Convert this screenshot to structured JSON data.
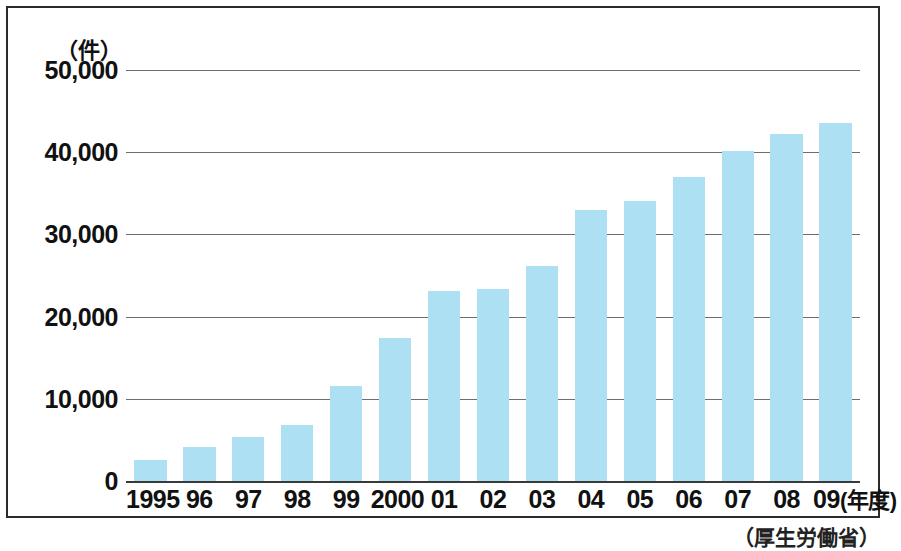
{
  "chart_data": {
    "type": "bar",
    "title": "",
    "subtitle": "",
    "unit_label": "（件）",
    "xlabel": "",
    "ylabel": "",
    "axis_suffix": "(年度)",
    "source": "（厚生労働省）",
    "bar_color": "#ace0f2",
    "grid": true,
    "legend": "none",
    "ylim": [
      0,
      50000
    ],
    "yticks": [
      0,
      10000,
      20000,
      30000,
      40000,
      50000
    ],
    "ytick_labels": [
      "0",
      "10,000",
      "20,000",
      "30,000",
      "40,000",
      "50,000"
    ],
    "categories": [
      "1995",
      "96",
      "97",
      "98",
      "99",
      "2000",
      "01",
      "02",
      "03",
      "04",
      "05",
      "06",
      "07",
      "08",
      "09"
    ],
    "values": [
      2600,
      4100,
      5300,
      6800,
      11500,
      17400,
      23100,
      23400,
      26200,
      33000,
      34100,
      37000,
      40200,
      42200,
      43600
    ]
  }
}
